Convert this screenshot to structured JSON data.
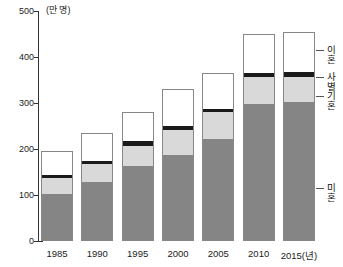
{
  "chart_data": {
    "type": "bar",
    "stacked": true,
    "title": "",
    "unit_label": "(만 명)",
    "categories": [
      "1985",
      "1990",
      "1995",
      "2000",
      "2005",
      "2010",
      "2015(년)"
    ],
    "series": [
      {
        "name": "미혼",
        "color": "#858585",
        "values": [
          100,
          125,
          160,
          185,
          220,
          295,
          300
        ]
      },
      {
        "name": "기혼",
        "color": "#d9d9d9",
        "values": [
          35,
          40,
          45,
          55,
          58,
          60,
          55
        ]
      },
      {
        "name": "사별",
        "color": "#1a1a1a",
        "values": [
          7,
          7,
          10,
          8,
          7,
          7,
          10
        ]
      },
      {
        "name": "이혼",
        "color": "#ffffff",
        "values": [
          53,
          63,
          65,
          82,
          80,
          88,
          90
        ]
      }
    ],
    "totals": [
      195,
      235,
      280,
      330,
      365,
      450,
      455
    ],
    "ylim": [
      0,
      500
    ],
    "yticks": [
      "0",
      "100",
      "200",
      "300",
      "400",
      "500"
    ],
    "grid": false,
    "legend_position": "right",
    "legend_order": [
      "이혼",
      "사별",
      "기혼",
      "미혼"
    ],
    "bar_border_color": "#878787",
    "axis_color": "#333333",
    "text_color": "#222222"
  }
}
